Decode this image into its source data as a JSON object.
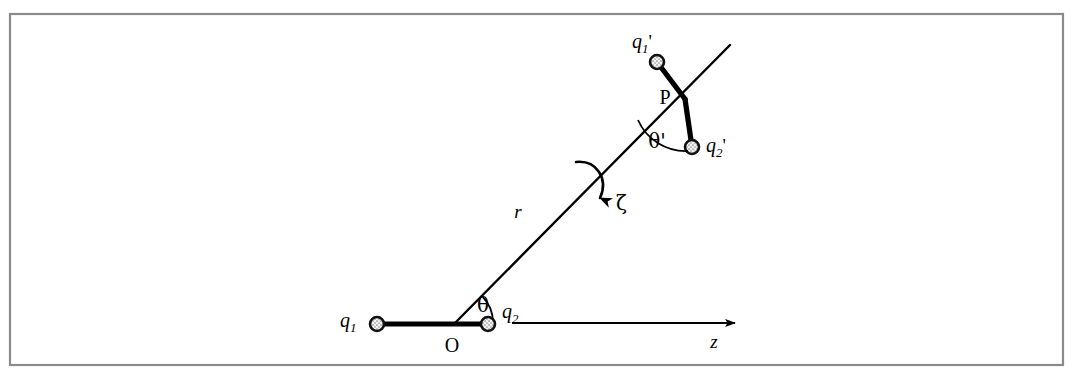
{
  "figure": {
    "background_color": "#ffffff",
    "frame_color": "#8a8a8a",
    "ink_color": "#000000"
  },
  "labels": {
    "q1": {
      "base": "q",
      "sub": "1",
      "prime": ""
    },
    "q2": {
      "base": "q",
      "sub": "2",
      "prime": ""
    },
    "q1p": {
      "base": "q",
      "sub": "1",
      "prime": "'"
    },
    "q2p": {
      "base": "q",
      "sub": "2",
      "prime": "'"
    },
    "origin": "O",
    "point_p": "P",
    "theta": "θ",
    "theta_prime": "θ'",
    "zeta": "ζ",
    "r": "r",
    "z_axis": "z"
  },
  "geometry": {
    "origin_point": {
      "x": 455,
      "y": 323
    },
    "point_p": {
      "x": 685,
      "y": 98
    },
    "q1_dot": {
      "x": 377,
      "y": 324
    },
    "q2_dot": {
      "x": 488,
      "y": 324
    },
    "q1p_dot": {
      "x": 657,
      "y": 62
    },
    "q2p_dot": {
      "x": 692,
      "y": 147
    },
    "r_line_end": {
      "x": 730,
      "y": 45
    },
    "z_axis_start": {
      "x": 512,
      "y": 323
    },
    "z_axis_end": {
      "x": 735,
      "y": 323
    },
    "theta_degrees": 45,
    "charge_radius": 7.0
  },
  "elements": {
    "lower_dipole_name": "lower-dipole",
    "upper_dipole_name": "upper-dipole",
    "separation_vector_name": "separation-vector-r",
    "rotation_arrow_name": "zeta-rotation-arrow",
    "axis_name": "z-axis"
  }
}
